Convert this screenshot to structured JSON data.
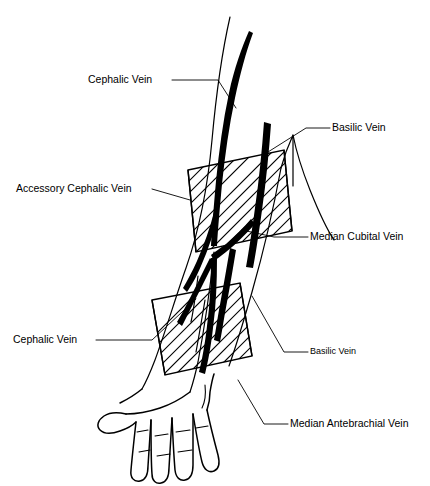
{
  "figure": {
    "background_color": "#ffffff",
    "ink_color": "#000000"
  },
  "labels": [
    {
      "id": "cephalic-vein-upper",
      "text": "Cephalic Vein",
      "text_x": 88,
      "text_y": 80,
      "side": "left",
      "size": "large"
    },
    {
      "id": "accessory-cephalic-vein",
      "text": "Accessory Cephalic Vein",
      "text_x": 16,
      "text_y": 189,
      "side": "left",
      "size": "large"
    },
    {
      "id": "cephalic-vein-lower",
      "text": "Cephalic Vein",
      "text_x": 13,
      "text_y": 340,
      "side": "left",
      "size": "large"
    },
    {
      "id": "basilic-vein-upper",
      "text": "Basilic Vein",
      "text_x": 332,
      "text_y": 128,
      "side": "right",
      "size": "large"
    },
    {
      "id": "median-cubital-vein",
      "text": "Median Cubital Vein",
      "text_x": 310,
      "text_y": 237,
      "side": "right",
      "size": "large"
    },
    {
      "id": "basilic-vein-lower",
      "text": "Basilic Vein",
      "text_x": 310,
      "text_y": 352,
      "side": "right",
      "size": "small"
    },
    {
      "id": "median-antebrachial-vein",
      "text": "Median Antebrachial Vein",
      "text_x": 290,
      "text_y": 424,
      "side": "right",
      "size": "large"
    }
  ],
  "anatomy": {
    "veins": [
      "cephalic-vein",
      "accessory-cephalic-vein",
      "basilic-vein",
      "median-cubital-vein",
      "median-antebrachial-vein"
    ],
    "hatched_bands": [
      {
        "id": "upper-hatched-band",
        "position": "antecubital"
      },
      {
        "id": "lower-hatched-band",
        "position": "distal-forearm"
      }
    ],
    "hand": {
      "fingers": 4,
      "thumb": 1
    }
  }
}
